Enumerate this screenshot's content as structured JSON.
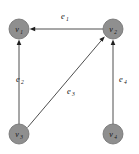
{
  "diagram": {
    "background_color": "#ffffff",
    "node_fill_color": "#8f8f8f",
    "node_stroke_color": "#6e6e6e",
    "edge_color": "#3a3a3a",
    "label_color": "#171717",
    "node_radius": 10,
    "nodes": [
      {
        "id": "v1",
        "base": "v",
        "sub": "1",
        "cx": 19,
        "cy": 29
      },
      {
        "id": "v2",
        "base": "v",
        "sub": "2",
        "cx": 113,
        "cy": 29
      },
      {
        "id": "v3",
        "base": "v",
        "sub": "3",
        "cx": 19,
        "cy": 134
      },
      {
        "id": "v4",
        "base": "v",
        "sub": "4",
        "cx": 113,
        "cy": 134
      }
    ],
    "edges": [
      {
        "id": "e1",
        "base": "e",
        "sub": "1",
        "from": "v2",
        "to": "v1",
        "label_x": 61,
        "label_y": 19,
        "x1": 103,
        "y1": 29,
        "x2": 30,
        "y2": 29
      },
      {
        "id": "e2",
        "base": "e",
        "sub": "2",
        "from": "v3",
        "to": "v1",
        "label_x": 16,
        "label_y": 82,
        "x1": 19,
        "y1": 124,
        "x2": 19,
        "y2": 40
      },
      {
        "id": "e3",
        "base": "e",
        "sub": "3",
        "from": "v3",
        "to": "v2",
        "label_x": 67,
        "label_y": 94,
        "x1": 28,
        "y1": 128,
        "x2": 105,
        "y2": 37
      },
      {
        "id": "e4",
        "base": "e",
        "sub": "4",
        "from": "v4",
        "to": "v2",
        "label_x": 119,
        "label_y": 82,
        "x1": 113,
        "y1": 124,
        "x2": 113,
        "y2": 40
      }
    ]
  }
}
